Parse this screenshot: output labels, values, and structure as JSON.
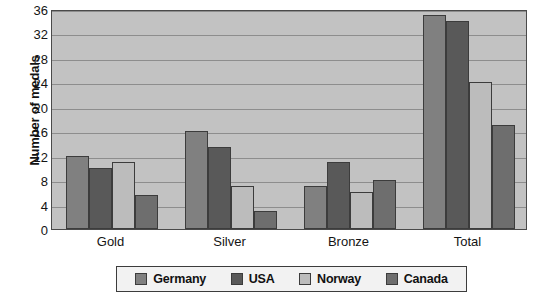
{
  "chart_data": {
    "type": "bar",
    "title": "",
    "subtitle": "",
    "xlabel": "",
    "ylabel": "Number of medals",
    "categories": [
      "Gold",
      "Silver",
      "Bronze",
      "Total"
    ],
    "series": [
      {
        "name": "Germany",
        "color": "#808080",
        "values": [
          12,
          16,
          7,
          35
        ]
      },
      {
        "name": "USA",
        "color": "#595959",
        "values": [
          10,
          13.5,
          11,
          34
        ]
      },
      {
        "name": "Norway",
        "color": "#bcbcbc",
        "values": [
          11,
          7,
          6,
          24
        ]
      },
      {
        "name": "Canada",
        "color": "#6e6e6e",
        "values": [
          5.5,
          3,
          8,
          17
        ]
      }
    ],
    "ylim": [
      0,
      36
    ],
    "ytick_step": 4,
    "yticks": [
      0,
      4,
      8,
      12,
      16,
      20,
      24,
      28,
      32,
      36
    ],
    "ytick_labels": [
      "0",
      "4",
      "8",
      "12",
      "16",
      "20",
      "24",
      "28",
      "32",
      "36"
    ],
    "grid": true,
    "grid_axis": "y",
    "legend_position": "bottom",
    "plot_background": "#c2c2c2",
    "gridline_color": "#8d8d8d",
    "axis_color": "#4a4a4a",
    "text_color": "#141414"
  },
  "legend": {
    "items": [
      {
        "label": "Germany"
      },
      {
        "label": "USA"
      },
      {
        "label": "Norway"
      },
      {
        "label": "Canada"
      }
    ]
  }
}
